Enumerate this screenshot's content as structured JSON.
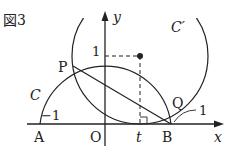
{
  "figure": {
    "title": "図3",
    "curves": {
      "c": "C",
      "c_prime": "C′"
    },
    "points": {
      "p": "P",
      "q": "Q",
      "a": "A",
      "o": "O",
      "b": "B",
      "t": "t"
    },
    "axes": {
      "x": "x",
      "y": "y"
    },
    "ticks": {
      "y_one": "1",
      "neg_one": "−1",
      "one": "1"
    },
    "colors": {
      "stroke": "#222222",
      "background": "#ffffff"
    }
  }
}
